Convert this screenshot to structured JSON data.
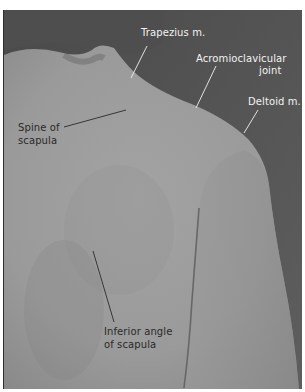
{
  "figure": {
    "type": "anatomical photograph",
    "colors": {
      "background_dark": "#585858",
      "skin": "#9c9c9c",
      "skin_shadow": "#8a8a8a",
      "label_light": "#f2f2f2",
      "label_dark": "#2a2a2a"
    },
    "labels": [
      {
        "id": "trapezius",
        "text": "Trapezius m."
      },
      {
        "id": "acromioclavicular_line1",
        "text": "Acromioclavicular"
      },
      {
        "id": "acromioclavicular_line2",
        "text": "joint"
      },
      {
        "id": "deltoid",
        "text": "Deltoid m."
      },
      {
        "id": "spine_line1",
        "text": "Spine of"
      },
      {
        "id": "spine_line2",
        "text": "scapula"
      },
      {
        "id": "inferior_line1",
        "text": "Inferior angle"
      },
      {
        "id": "inferior_line2",
        "text": "of scapula"
      }
    ]
  }
}
